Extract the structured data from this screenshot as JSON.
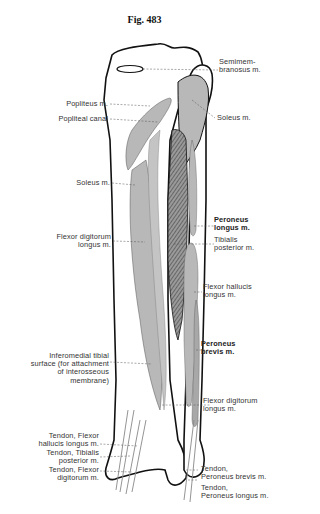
{
  "figure": {
    "title": "Fig. 483"
  },
  "colors": {
    "bone_fill": "#ffffff",
    "outline": "#111111",
    "muscle_fill": "#b8b8b8",
    "hatching": "#555555",
    "leader": "#555555",
    "text": "#333333"
  },
  "labels": {
    "semimembranosus": "Semimem-\nbranosus m.",
    "popliteus": "Popliteus m.",
    "popliteal_canal": "Popliteal canal",
    "soleus_right": "Soleus m.",
    "soleus_left": "Soleus m.",
    "flexor_digitorum_upper": "Flexor digitorum\nlongus m.",
    "peroneus_longus": "Peroneus\nlongus m.",
    "tibialis_posterior": "Tibialis\nposterior m.",
    "flexor_hallucis": "Flexor hallucis\nlongus m.",
    "inferomedial": "Inferomedial tibial\nsurface (for attachment\nof interosseous\nmembrane)",
    "peroneus_brevis": "Peroneus\nbrevis m.",
    "flexor_digitorum_lower": "Flexor digitorum\nlongus m.",
    "tendon_fhl": "Tendon, Flexor\nhallucis longus m.",
    "tendon_tp": "Tendon, Tibialis\nposterior m.",
    "tendon_fdl": "Tendon, Flexor\ndigitorum m.",
    "tendon_pb": "Tendon,\nPeroneus brevis m.",
    "tendon_pl": "Tendon,\nPeroneus longus m."
  }
}
